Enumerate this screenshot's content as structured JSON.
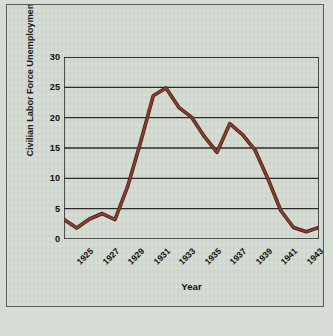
{
  "chart_data": {
    "type": "line",
    "title": "",
    "xlabel": "Year",
    "ylabel": "Civilian Labor Force Unemployment (percent)",
    "x": [
      1925,
      1926,
      1927,
      1928,
      1929,
      1930,
      1931,
      1932,
      1933,
      1934,
      1935,
      1936,
      1937,
      1938,
      1939,
      1940,
      1941,
      1942,
      1943,
      1944,
      1945
    ],
    "values": [
      3.2,
      1.8,
      3.3,
      4.2,
      3.2,
      8.7,
      15.9,
      23.6,
      24.9,
      21.7,
      20.1,
      16.9,
      14.3,
      19.0,
      17.2,
      14.6,
      9.9,
      4.7,
      1.9,
      1.2,
      1.9
    ],
    "xlim": [
      1925,
      1945
    ],
    "ylim": [
      0,
      30
    ],
    "yticks": [
      0,
      5,
      10,
      15,
      20,
      25,
      30
    ],
    "xticks": [
      1925,
      1927,
      1929,
      1931,
      1933,
      1935,
      1937,
      1939,
      1941,
      1943,
      1945
    ],
    "xtick_labels": [
      "1925",
      "1927",
      "1929",
      "1931",
      "1933",
      "1935",
      "1937",
      "1939",
      "1941",
      "1943",
      "1945"
    ],
    "ytick_labels": [
      "0",
      "5",
      "10",
      "15",
      "20",
      "25",
      "30"
    ],
    "grid": "horizontal",
    "legend": "none",
    "series_color": "#8c3b2b",
    "grid_color": "#2b2b2b",
    "background_color": "#d3dbd2",
    "border_color": "#55605a"
  }
}
